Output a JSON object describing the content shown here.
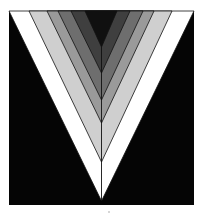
{
  "figure": {
    "canvas": {
      "width": 202,
      "height": 216,
      "background": "#ffffff"
    },
    "frame": {
      "x": 9,
      "y": 11,
      "width": 185,
      "height": 194,
      "color": "#050505"
    },
    "center_x": 101.5,
    "outline_color": "#111111",
    "bands": [
      {
        "name": "white",
        "color": "#ffffff",
        "top_left": 9,
        "top_right": 194,
        "apex_y": 201
      },
      {
        "name": "light-gray",
        "color": "#cfcfcf",
        "top_left": 29,
        "top_right": 172,
        "apex_y": 162
      },
      {
        "name": "mid-gray",
        "color": "#9a9a9a",
        "top_left": 47,
        "top_right": 154,
        "apex_y": 123
      },
      {
        "name": "gray",
        "color": "#6e6e6e",
        "top_left": 58,
        "top_right": 143,
        "apex_y": 100
      },
      {
        "name": "dark-gray",
        "color": "#3f3f3f",
        "top_left": 71,
        "top_right": 130,
        "apex_y": 73
      },
      {
        "name": "black-core",
        "color": "#101010",
        "top_left": 85,
        "top_right": 117,
        "apex_y": 47
      }
    ],
    "dot": {
      "x": 108,
      "y": 211,
      "color": "#c8c8c8"
    }
  }
}
